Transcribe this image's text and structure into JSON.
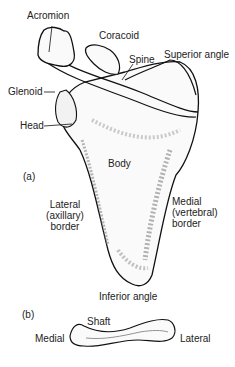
{
  "figure_a": {
    "panel_label": "(a)",
    "structure": "scapula",
    "labels": {
      "acromion": "Acromion",
      "coracoid": "Coracoid",
      "spine": "Spine",
      "superior_angle": "Superior angle",
      "glenoid": "Glenoid",
      "head": "Head",
      "body": "Body",
      "lateral_border": [
        "Lateral",
        "(axillary)",
        "border"
      ],
      "medial_border": [
        "Medial",
        "(vertebral)",
        "border"
      ],
      "inferior_angle": "Inferior angle"
    }
  },
  "figure_b": {
    "panel_label": "(b)",
    "structure": "clavicle",
    "labels": {
      "shaft": "Shaft",
      "medial": "Medial",
      "lateral": "Lateral"
    }
  }
}
